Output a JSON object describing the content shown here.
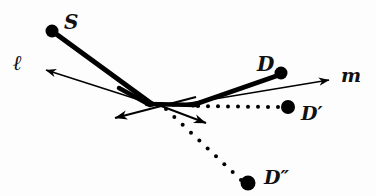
{
  "figure": {
    "background_color": "#fdfdfd",
    "ink_color": "#000000",
    "width": 376,
    "height": 196
  },
  "labels": {
    "source": "S",
    "line_l": "ℓ",
    "destination": "D",
    "line_m": "m",
    "image_prime": "D′",
    "image_double_prime": "D″"
  },
  "points": [
    {
      "name": "S",
      "x": 52,
      "y": 31,
      "radius": 6.5,
      "filled": true
    },
    {
      "name": "D",
      "x": 281,
      "y": 73,
      "radius": 6.5,
      "filled": true
    },
    {
      "name": "D'",
      "x": 288,
      "y": 107,
      "radius": 7.0,
      "filled": true
    },
    {
      "name": "D''",
      "x": 248,
      "y": 183,
      "radius": 7.5,
      "filled": true
    }
  ],
  "vertex": {
    "x": 150,
    "y": 104
  },
  "mirror_flat_end": {
    "x": 196,
    "y": 104
  },
  "thick_segments": [
    {
      "name": "incident-ray-S-to-vertex",
      "x1": 52,
      "y1": 31,
      "x2": 152,
      "y2": 104,
      "width": 5.0
    },
    {
      "name": "mirror-left-leg",
      "x1": 119,
      "y1": 88,
      "x2": 150,
      "y2": 105,
      "width": 4.5
    },
    {
      "name": "mirror-flat-base",
      "x1": 147,
      "y1": 104,
      "x2": 198,
      "y2": 105,
      "width": 4.5
    },
    {
      "name": "reflected-ray-to-D",
      "x1": 193,
      "y1": 105,
      "x2": 282,
      "y2": 74,
      "width": 5.0
    }
  ],
  "thin_arrows": [
    {
      "name": "line-l-arrow",
      "x1": 152,
      "y1": 104,
      "x2": 38,
      "y2": 68,
      "width": 1.6
    },
    {
      "name": "line-m-arrow",
      "x1": 172,
      "y1": 106,
      "x2": 335,
      "y2": 79,
      "width": 1.6
    },
    {
      "name": "normal-arrow-left",
      "x1": 196,
      "y1": 97,
      "x2": 107,
      "y2": 120,
      "width": 1.8
    },
    {
      "name": "normal-arrow-right",
      "x1": 140,
      "y1": 98,
      "x2": 213,
      "y2": 126,
      "width": 1.8
    }
  ],
  "dotted_paths": [
    {
      "name": "dotted-to-D-prime",
      "x1": 198,
      "y1": 106,
      "x2": 278,
      "y2": 107,
      "dot_radius": 2.0,
      "spacing": 10
    },
    {
      "name": "dotted-to-D-double-prime",
      "x1": 166,
      "y1": 109,
      "x2": 241,
      "y2": 180,
      "dot_radius": 2.0,
      "spacing": 11
    }
  ]
}
